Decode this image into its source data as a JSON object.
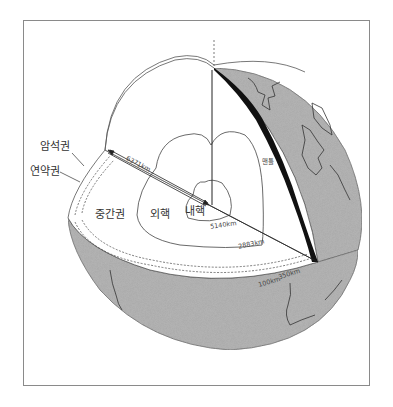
{
  "diagram": {
    "title": "",
    "colors": {
      "globe_surface": "#a8a8a8",
      "cross_section": "#ffffff",
      "crust": "#111111",
      "outline": "#555555",
      "frame": "#8a8a8a"
    },
    "labels": {
      "lithosphere": "암석권",
      "asthenosphere": "연약권",
      "mesosphere": "중간권",
      "outer_core": "외핵",
      "inner_core": "내핵",
      "mantle": "맨틀"
    },
    "distances": {
      "earth_radius": "6371km",
      "inner_core_boundary": "5140km",
      "core_mantle_boundary": "2883km",
      "lithosphere_depth": "100km",
      "asthenosphere_depth": "350km"
    }
  }
}
